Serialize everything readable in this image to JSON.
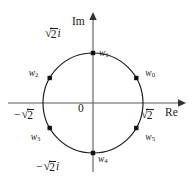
{
  "figure": {
    "geometry": {
      "center_x": 93,
      "center_y": 103,
      "radius": 50,
      "circle_color": "#1a1a1a",
      "axis_color": "#595959",
      "point_color": "#111111"
    },
    "axes": {
      "imaginary_label": "Im",
      "real_label": "Re",
      "origin_label": "0"
    },
    "tick_labels": {
      "top": {
        "surd": "√",
        "radicand": "2",
        "suffix": "i"
      },
      "bottom": {
        "prefix": "−",
        "surd": "√",
        "radicand": "2",
        "suffix": "i"
      },
      "right": {
        "surd": "√",
        "radicand": "2",
        "suffix": ""
      },
      "left": {
        "prefix": "−",
        "surd": "√",
        "radicand": "2",
        "suffix": ""
      }
    },
    "points": [
      {
        "id": "w0",
        "base": "w",
        "sub": "0",
        "angle_deg": 30,
        "label_dx": 9,
        "label_dy": -9
      },
      {
        "id": "w1",
        "base": "w",
        "sub": "1",
        "angle_deg": 90,
        "label_dx": 6,
        "label_dy": -4
      },
      {
        "id": "w2",
        "base": "w",
        "sub": "2",
        "angle_deg": 150,
        "label_dx": -21,
        "label_dy": -9
      },
      {
        "id": "w3",
        "base": "w",
        "sub": "3",
        "angle_deg": 210,
        "label_dx": -19,
        "label_dy": 5
      },
      {
        "id": "w4",
        "base": "w",
        "sub": "4",
        "angle_deg": 270,
        "label_dx": 5,
        "label_dy": 2
      },
      {
        "id": "w5",
        "base": "w",
        "sub": "5",
        "angle_deg": 330,
        "label_dx": 9,
        "label_dy": 5
      }
    ]
  }
}
